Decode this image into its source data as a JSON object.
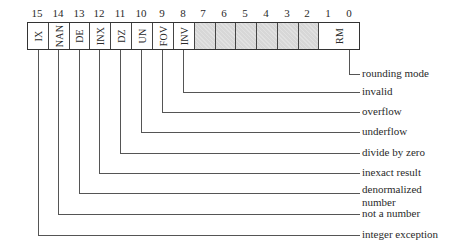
{
  "register": {
    "bit_numbers": [
      "15",
      "14",
      "13",
      "12",
      "11",
      "10",
      "9",
      "8",
      "7",
      "6",
      "5",
      "4",
      "3",
      "2",
      "1",
      "0"
    ],
    "fields": [
      {
        "bits": "15",
        "abbr": "IX",
        "shaded": false
      },
      {
        "bits": "14",
        "abbr": "NAN",
        "shaded": false
      },
      {
        "bits": "13",
        "abbr": "DE",
        "shaded": false
      },
      {
        "bits": "12",
        "abbr": "INX",
        "shaded": false
      },
      {
        "bits": "11",
        "abbr": "DZ",
        "shaded": false
      },
      {
        "bits": "10",
        "abbr": "UN",
        "shaded": false
      },
      {
        "bits": "9",
        "abbr": "FOV",
        "shaded": false
      },
      {
        "bits": "8",
        "abbr": "INV",
        "shaded": false
      },
      {
        "bits": "7",
        "abbr": "",
        "shaded": true
      },
      {
        "bits": "6",
        "abbr": "",
        "shaded": true
      },
      {
        "bits": "5",
        "abbr": "",
        "shaded": true
      },
      {
        "bits": "4",
        "abbr": "",
        "shaded": true
      },
      {
        "bits": "3",
        "abbr": "",
        "shaded": true
      },
      {
        "bits": "2",
        "abbr": "",
        "shaded": true
      },
      {
        "bits": "1-0",
        "abbr": "RM",
        "shaded": false
      }
    ]
  },
  "legend": {
    "rounding_mode": "rounding mode",
    "invalid": "invalid",
    "overflow": "overflow",
    "underflow": "underflow",
    "divide_by_zero": "divide by zero",
    "inexact_result": "inexact result",
    "denormalized_line1": "denormalized",
    "denormalized_line2": "number",
    "not_a_number": "not a number",
    "integer_exception": "integer exception"
  },
  "colors": {
    "line": "#555555",
    "shaded_cell": "#d7d7d7",
    "text": "#2a2a2a"
  }
}
